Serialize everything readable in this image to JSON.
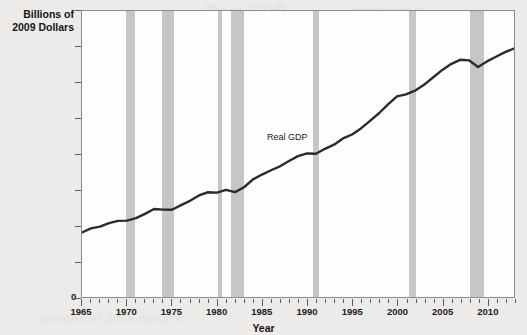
{
  "figure": {
    "background_color": "#edebe9",
    "plot_background_color": "#fdfdfd",
    "frame_color": "#8c8c8c",
    "line_color": "#2b2b2b",
    "recession_band_color": "#c6c6c6",
    "bleed_through_text": [
      "Real GDP",
      "PPF 1965-",
      "of 2009",
      "billions of 2009 dollars"
    ]
  },
  "chart_data": {
    "type": "line",
    "title": "",
    "xlabel": "Year",
    "ylabel": "Billions of\n2009 Dollars",
    "ylabel_lines": [
      "Billions of",
      "2009 Dollars"
    ],
    "xlim": [
      1965,
      2013
    ],
    "ylim": [
      0,
      16000
    ],
    "grid": false,
    "legend_position": "none",
    "y_ticks": [
      0,
      2000,
      4000,
      6000,
      8000,
      10000,
      12000,
      14000,
      16000
    ],
    "y_tick_labels": [
      "0",
      "2,000",
      "4,000",
      "6,000",
      "8,000",
      "10,000",
      "12,000",
      "14,000",
      "16,000"
    ],
    "x_ticks_major": [
      1965,
      1970,
      1975,
      1980,
      1985,
      1990,
      1995,
      2000,
      2005,
      2010
    ],
    "x_tick_labels": [
      "1965",
      "1970",
      "1975",
      "1980",
      "1985",
      "1990",
      "1995",
      "2000",
      "2005",
      "2010"
    ],
    "x_minor_tick_interval": 1,
    "annotations": [
      {
        "text": "Real GDP",
        "x": 1988.0,
        "y": 8850
      }
    ],
    "shaded_regions": {
      "name": "Recessions",
      "color": "#c6c6c6",
      "spans": [
        {
          "start": 1969.9,
          "end": 1970.9
        },
        {
          "start": 1973.9,
          "end": 1975.2
        },
        {
          "start": 1980.0,
          "end": 1980.5
        },
        {
          "start": 1981.5,
          "end": 1982.9
        },
        {
          "start": 1990.5,
          "end": 1991.2
        },
        {
          "start": 2001.2,
          "end": 2001.9
        },
        {
          "start": 2007.9,
          "end": 2009.5
        }
      ]
    },
    "series": [
      {
        "name": "Real GDP",
        "x": [
          1965,
          1966,
          1967,
          1968,
          1969,
          1970,
          1971,
          1972,
          1973,
          1974,
          1975,
          1976,
          1977,
          1978,
          1979,
          1980,
          1981,
          1982,
          1983,
          1984,
          1985,
          1986,
          1987,
          1988,
          1989,
          1990,
          1991,
          1992,
          1993,
          1994,
          1995,
          1996,
          1997,
          1998,
          1999,
          2000,
          2001,
          2002,
          2003,
          2004,
          2005,
          2006,
          2007,
          2008,
          2009,
          2010,
          2011,
          2012,
          2013
        ],
        "values": [
          3610,
          3840,
          3940,
          4130,
          4260,
          4270,
          4410,
          4650,
          4920,
          4890,
          4880,
          5140,
          5380,
          5680,
          5860,
          5840,
          5990,
          5870,
          6140,
          6580,
          6850,
          7090,
          7310,
          7610,
          7880,
          8030,
          8010,
          8290,
          8520,
          8870,
          9090,
          9430,
          9850,
          10280,
          10780,
          11220,
          11340,
          11540,
          11870,
          12280,
          12690,
          13030,
          13270,
          13240,
          12870,
          13180,
          13440,
          13700,
          13900
        ]
      }
    ]
  }
}
